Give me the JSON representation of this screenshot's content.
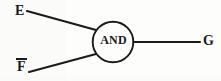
{
  "figure": {
    "type": "logic-gate-diagram",
    "background_color": "#fdfdfc",
    "stroke_color": "#1a1a1a",
    "gate": {
      "label": "AND",
      "shape": "circle",
      "center_x": 113,
      "center_y": 42,
      "radius": 20.5
    },
    "inputs": [
      {
        "id": "input-e",
        "label": "E",
        "overbar": false,
        "label_x": 15,
        "label_y": 4,
        "line": {
          "x1": 27,
          "y1": 11,
          "x2": 96,
          "y2": 30
        }
      },
      {
        "id": "input-f",
        "label": "F",
        "overbar": true,
        "label_x": 17,
        "label_y": 58,
        "line": {
          "x1": 29,
          "y1": 72,
          "x2": 96,
          "y2": 54
        }
      }
    ],
    "outputs": [
      {
        "id": "output-g",
        "label": "G",
        "overbar": false,
        "label_x": 203,
        "label_y": 34,
        "line": {
          "x1": 133,
          "y1": 42,
          "x2": 200,
          "y2": 42
        }
      }
    ]
  }
}
